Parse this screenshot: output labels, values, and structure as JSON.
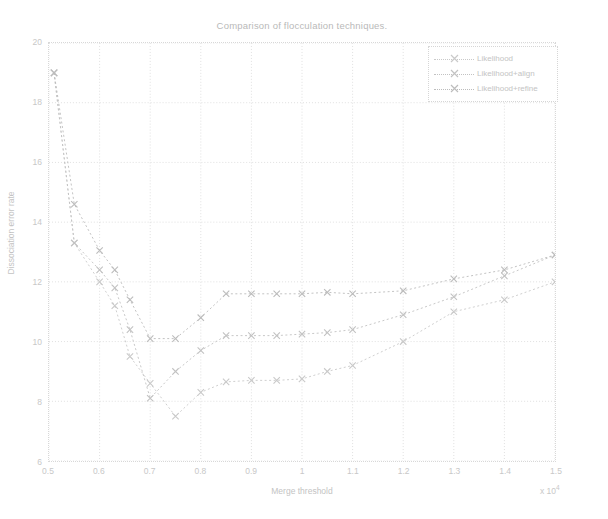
{
  "title": "Comparison of flocculation techniques.",
  "axes": {
    "xlabel": "Merge threshold",
    "ylabel": "Dissociation error rate",
    "x_exponent_base": "x 10",
    "x_exponent_power": "4",
    "xlim": [
      0.5,
      1.5
    ],
    "ylim": [
      6,
      20
    ],
    "xticks": [
      0.5,
      0.6,
      0.7,
      0.8,
      0.9,
      1.0,
      1.1,
      1.2,
      1.3,
      1.4,
      1.5
    ],
    "xticklabels": [
      "0.5",
      "0.6",
      "0.7",
      "0.8",
      "0.9",
      "1",
      "1.1",
      "1.2",
      "1.3",
      "1.4",
      "1.5"
    ],
    "yticks": [
      6,
      8,
      10,
      12,
      14,
      16,
      18,
      20
    ],
    "yticklabels": [
      "6",
      "8",
      "10",
      "12",
      "14",
      "16",
      "18",
      "20"
    ],
    "grid": true,
    "box": true
  },
  "colors": {
    "axis": "#d8d8d8",
    "text": "#c4c4c4",
    "series_1": "#c9c9c9",
    "series_2": "#c2c2c2",
    "series_3": "#bcbcbc",
    "background": "#ffffff"
  },
  "legend": {
    "position": "top-right",
    "entries": [
      {
        "label": "Likelihood",
        "marker": "x"
      },
      {
        "label": "Likelihood+align",
        "marker": "x"
      },
      {
        "label": "Likelihood+refine",
        "marker": "x"
      }
    ]
  },
  "chart_data": {
    "type": "line",
    "title": "Comparison of flocculation techniques.",
    "xlabel": "Merge threshold",
    "ylabel": "Dissociation error rate",
    "xlim": [
      0.5,
      1.5
    ],
    "ylim": [
      6,
      20
    ],
    "grid": true,
    "legend_position": "top-right",
    "x_scale_note": "x-axis values are multiplied by 10^4",
    "series": [
      {
        "name": "Likelihood",
        "marker": "x",
        "linestyle": "dotted",
        "x": [
          0.51,
          0.55,
          0.6,
          0.63,
          0.66,
          0.7,
          0.75,
          0.8,
          0.85,
          0.9,
          0.95,
          1.0,
          1.05,
          1.1,
          1.2,
          1.3,
          1.4,
          1.5
        ],
        "y": [
          19.0,
          13.3,
          12.0,
          11.2,
          9.5,
          8.6,
          7.5,
          8.3,
          8.65,
          8.7,
          8.7,
          8.75,
          9.0,
          9.2,
          10.0,
          11.0,
          11.4,
          12.0
        ]
      },
      {
        "name": "Likelihood+align",
        "marker": "x",
        "linestyle": "dotted",
        "x": [
          0.51,
          0.55,
          0.6,
          0.63,
          0.66,
          0.7,
          0.75,
          0.8,
          0.85,
          0.9,
          0.95,
          1.0,
          1.05,
          1.1,
          1.2,
          1.3,
          1.4,
          1.5
        ],
        "y": [
          19.0,
          13.3,
          12.4,
          11.8,
          10.4,
          8.1,
          9.0,
          9.7,
          10.2,
          10.2,
          10.2,
          10.25,
          10.3,
          10.4,
          10.9,
          11.5,
          12.2,
          12.9
        ]
      },
      {
        "name": "Likelihood+refine",
        "marker": "x",
        "linestyle": "dotted",
        "x": [
          0.51,
          0.55,
          0.6,
          0.63,
          0.66,
          0.7,
          0.75,
          0.8,
          0.85,
          0.9,
          0.95,
          1.0,
          1.05,
          1.1,
          1.2,
          1.3,
          1.4,
          1.5
        ],
        "y": [
          19.0,
          14.6,
          13.05,
          12.4,
          11.4,
          10.1,
          10.1,
          10.8,
          11.6,
          11.6,
          11.6,
          11.6,
          11.65,
          11.6,
          11.7,
          12.1,
          12.4,
          12.9
        ]
      }
    ]
  }
}
